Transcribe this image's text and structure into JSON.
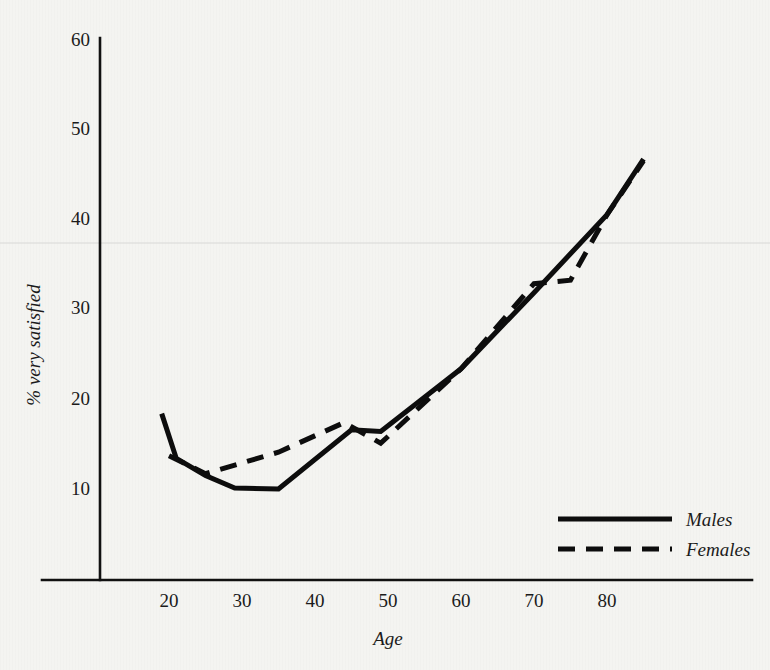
{
  "chart_data": {
    "type": "line",
    "title": "",
    "xlabel": "Age",
    "ylabel": "% very satisfied",
    "xlim": [
      12,
      88
    ],
    "ylim": [
      0,
      60
    ],
    "x_ticks": [
      20,
      30,
      40,
      50,
      60,
      70,
      80
    ],
    "y_ticks": [
      10,
      20,
      30,
      40,
      50,
      60
    ],
    "grid": false,
    "legend_position": "bottom-right",
    "series": [
      {
        "name": "Males",
        "style": "solid",
        "color": "#0d0d0d",
        "points": [
          {
            "x": 19,
            "y": 18.3
          },
          {
            "x": 21,
            "y": 13.3
          },
          {
            "x": 25,
            "y": 11.4
          },
          {
            "x": 29,
            "y": 10.0
          },
          {
            "x": 35,
            "y": 9.9
          },
          {
            "x": 45,
            "y": 16.5
          },
          {
            "x": 49,
            "y": 16.3
          },
          {
            "x": 60,
            "y": 23.3
          },
          {
            "x": 70,
            "y": 31.8
          },
          {
            "x": 80,
            "y": 40.5
          },
          {
            "x": 85,
            "y": 46.7
          }
        ]
      },
      {
        "name": "Females",
        "style": "dashed",
        "color": "#0d0d0d",
        "points": [
          {
            "x": 20,
            "y": 13.6
          },
          {
            "x": 25,
            "y": 11.6
          },
          {
            "x": 35,
            "y": 14.0
          },
          {
            "x": 44,
            "y": 17.3
          },
          {
            "x": 49,
            "y": 15.0
          },
          {
            "x": 60,
            "y": 23.3
          },
          {
            "x": 70,
            "y": 32.8
          },
          {
            "x": 75,
            "y": 33.2
          },
          {
            "x": 80,
            "y": 40.5
          },
          {
            "x": 85,
            "y": 46.5
          }
        ]
      }
    ]
  },
  "axes": {
    "y_tick_labels": [
      "60",
      "50",
      "40",
      "30",
      "20",
      "10"
    ],
    "x_tick_labels": [
      "20",
      "30",
      "40",
      "50",
      "60",
      "70",
      "80"
    ],
    "y_axis_title": "% very satisfied",
    "x_axis_title": "Age"
  },
  "legend": {
    "entries": [
      {
        "label": "Males",
        "style": "solid"
      },
      {
        "label": "Females",
        "style": "dashed"
      }
    ]
  }
}
